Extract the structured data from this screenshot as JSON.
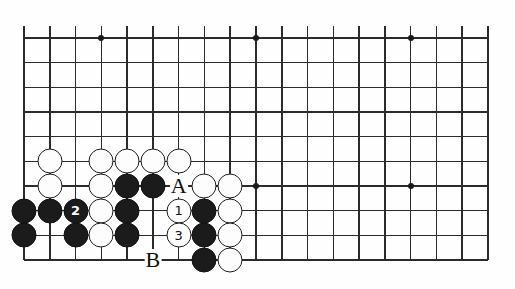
{
  "diagram": {
    "type": "go-board-diagram",
    "game": "Go",
    "board_size": 19,
    "visible_region": {
      "columns": 19,
      "rows": 10,
      "description": "Top-left portion of a 19x19 Go board, lower edge shown"
    },
    "geometry": {
      "origin_x": 24,
      "origin_y": 38,
      "col_spacing": 25.78,
      "row_spacing": 24.67,
      "stone_diameter": 25
    },
    "colors": {
      "line": "#2b2b2b",
      "black_stone": "#1b1b1b",
      "white_stone": "#fdfdfd",
      "white_stone_outline": "#1b1b1b",
      "background": "#ffffff",
      "label_text": "#101010"
    },
    "star_points": [
      {
        "col": 4,
        "row": 1
      },
      {
        "col": 10,
        "row": 1
      },
      {
        "col": 16,
        "row": 1
      },
      {
        "col": 10,
        "row": 7
      },
      {
        "col": 16,
        "row": 7
      }
    ],
    "stones": [
      {
        "col": 2,
        "row": 6,
        "color": "white",
        "label": ""
      },
      {
        "col": 4,
        "row": 6,
        "color": "white",
        "label": ""
      },
      {
        "col": 5,
        "row": 6,
        "color": "white",
        "label": ""
      },
      {
        "col": 6,
        "row": 6,
        "color": "white",
        "label": ""
      },
      {
        "col": 7,
        "row": 6,
        "color": "white",
        "label": ""
      },
      {
        "col": 2,
        "row": 7,
        "color": "white",
        "label": ""
      },
      {
        "col": 4,
        "row": 7,
        "color": "white",
        "label": ""
      },
      {
        "col": 5,
        "row": 7,
        "color": "black",
        "label": ""
      },
      {
        "col": 6,
        "row": 7,
        "color": "black",
        "label": ""
      },
      {
        "col": 8,
        "row": 7,
        "color": "white",
        "label": ""
      },
      {
        "col": 9,
        "row": 7,
        "color": "white",
        "label": ""
      },
      {
        "col": 1,
        "row": 8,
        "color": "black",
        "label": ""
      },
      {
        "col": 2,
        "row": 8,
        "color": "black",
        "label": ""
      },
      {
        "col": 3,
        "row": 8,
        "color": "black",
        "label": "2"
      },
      {
        "col": 4,
        "row": 8,
        "color": "white",
        "label": ""
      },
      {
        "col": 5,
        "row": 8,
        "color": "black",
        "label": ""
      },
      {
        "col": 7,
        "row": 8,
        "color": "white",
        "label": "1"
      },
      {
        "col": 8,
        "row": 8,
        "color": "black",
        "label": ""
      },
      {
        "col": 9,
        "row": 8,
        "color": "white",
        "label": ""
      },
      {
        "col": 1,
        "row": 9,
        "color": "black",
        "label": ""
      },
      {
        "col": 3,
        "row": 9,
        "color": "black",
        "label": ""
      },
      {
        "col": 4,
        "row": 9,
        "color": "white",
        "label": ""
      },
      {
        "col": 5,
        "row": 9,
        "color": "black",
        "label": ""
      },
      {
        "col": 7,
        "row": 9,
        "color": "white",
        "label": "3"
      },
      {
        "col": 8,
        "row": 9,
        "color": "black",
        "label": ""
      },
      {
        "col": 9,
        "row": 9,
        "color": "white",
        "label": ""
      },
      {
        "col": 8,
        "row": 10,
        "color": "black",
        "label": ""
      },
      {
        "col": 9,
        "row": 10,
        "color": "white",
        "label": ""
      }
    ],
    "point_labels": [
      {
        "col": 7,
        "row": 7,
        "text": "A"
      },
      {
        "col": 6,
        "row": 10,
        "text": "B"
      }
    ],
    "move_numbers": [
      {
        "number": "1",
        "color": "white"
      },
      {
        "number": "2",
        "color": "black"
      },
      {
        "number": "3",
        "color": "white"
      }
    ]
  }
}
